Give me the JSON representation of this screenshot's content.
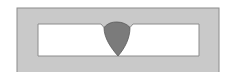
{
  "diagram": {
    "type": "weld-cross-section",
    "colors": {
      "background": "#ffffff",
      "base_metal": "#c8c8c8",
      "outline": "#8a8a8a",
      "gap": "#ffffff",
      "weld_bead": "#7a7a7a"
    },
    "parts": [
      "base-metal-frame",
      "inner-gap",
      "v-groove",
      "weld-bead"
    ]
  }
}
